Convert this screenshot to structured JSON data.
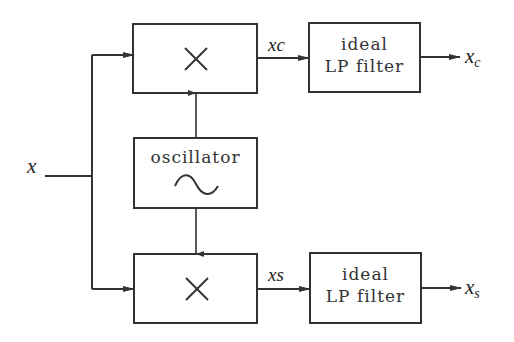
{
  "diagram": {
    "input": {
      "label": "x"
    },
    "multiplier_top": {
      "symbol": "×"
    },
    "multiplier_bottom": {
      "symbol": "×"
    },
    "oscillator": {
      "label": "oscillator",
      "icon": "sine-wave-icon"
    },
    "signal_top": {
      "label": "xc"
    },
    "signal_bottom": {
      "label": "xs"
    },
    "filter_top": {
      "line1": "ideal",
      "line2": "LP filter"
    },
    "filter_bottom": {
      "line1": "ideal",
      "line2": "LP filter"
    },
    "output_top": {
      "base": "x",
      "sub": "c"
    },
    "output_bottom": {
      "base": "x",
      "sub": "s"
    },
    "colors": {
      "stroke": "#333333",
      "background": "#ffffff"
    }
  }
}
